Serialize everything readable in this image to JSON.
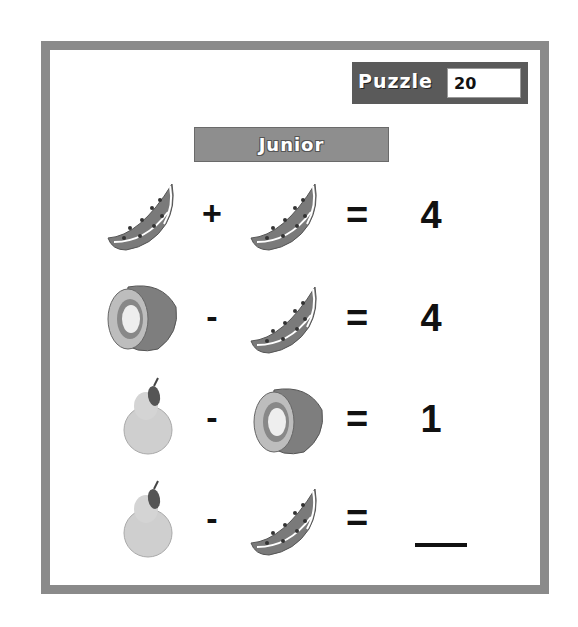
{
  "header": {
    "puzzle_label": "Puzzle",
    "puzzle_number": "20",
    "level": "Junior"
  },
  "equations": [
    {
      "left": "watermelon-slice",
      "operator": "+",
      "right": "watermelon-slice",
      "equals": "=",
      "answer": "4"
    },
    {
      "left": "kiwi",
      "operator": "-",
      "right": "watermelon-slice",
      "equals": "=",
      "answer": "4"
    },
    {
      "left": "pear",
      "operator": "-",
      "right": "kiwi",
      "equals": "=",
      "answer": "1"
    },
    {
      "left": "pear",
      "operator": "-",
      "right": "watermelon-slice",
      "equals": "=",
      "answer": ""
    }
  ],
  "colors": {
    "frame": "#8a8a8a",
    "puzzle_box": "#5a5a5a",
    "banner": "#8e8e8e"
  }
}
